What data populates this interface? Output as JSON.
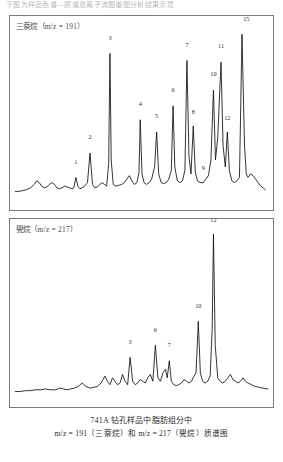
{
  "header_strip": "下图为样品色谱—质谱总离子流图谱图分析结果示意",
  "caption": {
    "line1": "741A 钻孔样品中脂肪组分中",
    "line2": "m/z = 191（三萘烷）和 m/z = 217（甖烷）质谱图"
  },
  "colors": {
    "trace": "#111111",
    "panel_border": "#7a7a7a",
    "label_text": "#4a4a4a",
    "background": "#ffffff"
  },
  "chart_data": [
    {
      "type": "line",
      "title": "三萘烷（m/z = 191）",
      "ion": "m/z = 191",
      "compound_class": "三萘烷",
      "xlabel": "",
      "ylabel": "",
      "xlim": [
        0,
        100
      ],
      "ylim": [
        0,
        100
      ],
      "grid": false,
      "legend": "none",
      "labeled_peaks": [
        {
          "id": "1",
          "x": 24.0,
          "y": 12.0,
          "label_y": 16.5
        },
        {
          "id": "2",
          "x": 29.6,
          "y": 26.0,
          "label_y": 30.5
        },
        {
          "id": "3",
          "x": 37.5,
          "y": 83.0,
          "label_y": 87.5
        },
        {
          "id": "4",
          "x": 49.5,
          "y": 45.0,
          "label_y": 49.5
        },
        {
          "id": "5",
          "x": 56.0,
          "y": 38.0,
          "label_y": 42.5
        },
        {
          "id": "6",
          "x": 62.5,
          "y": 53.0,
          "label_y": 57.5
        },
        {
          "id": "7",
          "x": 68.0,
          "y": 79.0,
          "label_y": 83.5
        },
        {
          "id": "8",
          "x": 70.5,
          "y": 41.5,
          "label_y": 45.0
        },
        {
          "id": "9",
          "x": 74.5,
          "y": 9.0,
          "label_y": 13.0
        },
        {
          "id": "10",
          "x": 78.5,
          "y": 62.0,
          "label_y": 66.5
        },
        {
          "id": "11",
          "x": 81.5,
          "y": 78.0,
          "label_y": 82.5
        },
        {
          "id": "12",
          "x": 84.0,
          "y": 38.0,
          "label_y": 41.5
        },
        {
          "id": "15",
          "x": 91.5,
          "y": 94.0,
          "label_y": 98.0
        }
      ],
      "series": [
        {
          "name": "TIC m/z 191",
          "x": [
            0,
            1.5,
            3,
            4.5,
            6,
            7.5,
            8.5,
            9.5,
            10.5,
            11.5,
            12.5,
            13.5,
            14.5,
            15.5,
            16.5,
            17.5,
            18.5,
            19.5,
            20.5,
            21.5,
            22.5,
            23.2,
            24.0,
            24.8,
            25.6,
            26.5,
            27.5,
            28.6,
            29.6,
            30.6,
            31.5,
            32.5,
            33.5,
            34.5,
            35.3,
            36.2,
            37.0,
            37.5,
            38.0,
            38.8,
            39.8,
            41.0,
            42.2,
            43.2,
            44.2,
            45.2,
            46.2,
            47.2,
            48.2,
            49.0,
            49.5,
            50.2,
            51.0,
            52.0,
            53.0,
            54.0,
            55.2,
            56.0,
            56.8,
            57.8,
            58.8,
            59.8,
            60.8,
            61.8,
            62.5,
            63.2,
            64.2,
            65.2,
            66.2,
            67.2,
            68.0,
            68.8,
            69.6,
            70.5,
            71.3,
            72.2,
            73.2,
            74.5,
            75.5,
            76.5,
            77.5,
            78.5,
            79.3,
            80.2,
            81.5,
            82.3,
            83.2,
            84.0,
            84.8,
            85.8,
            86.8,
            87.8,
            88.8,
            89.8,
            90.8,
            91.5,
            92.2,
            93.2,
            94.2,
            95.2,
            96.2,
            97.2,
            98.2,
            99.0,
            100
          ],
          "y": [
            4,
            4,
            4.5,
            5,
            6,
            8,
            10,
            9,
            7,
            6,
            6.5,
            8,
            9,
            8,
            6,
            5.5,
            6,
            7,
            6.5,
            6,
            5.5,
            6,
            12,
            7,
            5.5,
            6,
            7,
            9,
            26,
            8,
            6,
            6.5,
            8,
            9,
            8,
            7,
            20,
            83,
            22,
            8,
            7,
            7.5,
            8,
            9,
            11,
            13,
            10,
            8,
            9,
            15,
            45,
            14,
            9,
            8,
            9,
            11,
            18,
            38,
            14,
            9,
            8.5,
            9,
            11,
            16,
            53,
            18,
            10,
            9,
            10,
            16,
            79,
            24,
            14,
            41.5,
            15,
            10,
            9,
            9,
            11,
            13,
            22,
            62,
            22,
            35,
            78,
            30,
            18,
            38,
            16,
            10,
            9,
            10,
            12,
            94,
            30,
            14,
            12,
            14,
            13,
            11,
            9,
            7,
            6,
            5
          ]
        }
      ]
    },
    {
      "type": "line",
      "title": "甖烷（m/z = 217）",
      "ion": "m/z = 217",
      "compound_class": "甖烷",
      "xlabel": "",
      "ylabel": "",
      "xlim": [
        0,
        100
      ],
      "ylim": [
        0,
        100
      ],
      "grid": false,
      "legend": "none",
      "labeled_peaks": [
        {
          "id": "3",
          "x": 45.5,
          "y": 23.0,
          "label_y": 27.5
        },
        {
          "id": "6",
          "x": 55.5,
          "y": 30.0,
          "label_y": 34.5
        },
        {
          "id": "7",
          "x": 61.0,
          "y": 21.0,
          "label_y": 25.5
        },
        {
          "id": "10",
          "x": 72.5,
          "y": 44.0,
          "label_y": 48.5
        },
        {
          "id": "12",
          "x": 78.5,
          "y": 95.0,
          "label_y": 99.0
        }
      ],
      "series": [
        {
          "name": "TIC m/z 217",
          "x": [
            0,
            2,
            4,
            6,
            8,
            10,
            12,
            14,
            16,
            17.5,
            19,
            20.5,
            22,
            23.5,
            25,
            26.5,
            28,
            29.5,
            31,
            32.5,
            34,
            35.5,
            36.5,
            37.5,
            38.5,
            39.5,
            40.5,
            41.5,
            42.5,
            43.5,
            44.5,
            45.5,
            46.5,
            47.5,
            48.5,
            49.5,
            50.5,
            51.5,
            52.5,
            53.5,
            54.5,
            55.5,
            56.5,
            57.5,
            58.5,
            59.5,
            60.2,
            61.0,
            61.8,
            62.8,
            63.8,
            64.8,
            65.8,
            66.8,
            67.8,
            68.8,
            69.8,
            70.8,
            71.6,
            72.5,
            73.3,
            74.2,
            75.2,
            76.2,
            77.2,
            78.0,
            78.5,
            79.2,
            80.2,
            81.2,
            82.2,
            83.2,
            84.2,
            85.2,
            86.2,
            87.2,
            88.2,
            89.2,
            90.2,
            91.2,
            92.2,
            93.5,
            95,
            96.5,
            98,
            100
          ],
          "y": [
            3,
            3,
            3.5,
            3.5,
            4,
            4,
            4.5,
            4,
            4,
            5,
            4.5,
            4,
            4.5,
            5,
            6,
            8,
            6,
            5,
            5.5,
            6,
            8,
            12,
            9,
            7,
            11,
            9,
            7,
            8,
            13,
            9,
            7,
            23,
            9,
            7,
            8,
            10,
            9,
            8,
            11,
            13,
            9,
            30,
            11,
            9,
            14,
            16,
            11,
            21,
            9,
            7,
            6.5,
            7,
            8,
            10,
            9,
            8,
            9,
            12,
            14,
            44,
            14,
            9,
            8,
            9,
            12,
            40,
            95,
            30,
            11,
            9,
            8,
            9,
            11,
            13,
            10,
            9,
            8,
            9,
            11,
            9,
            8,
            7,
            6,
            5.5,
            5,
            4.5
          ]
        }
      ]
    }
  ]
}
